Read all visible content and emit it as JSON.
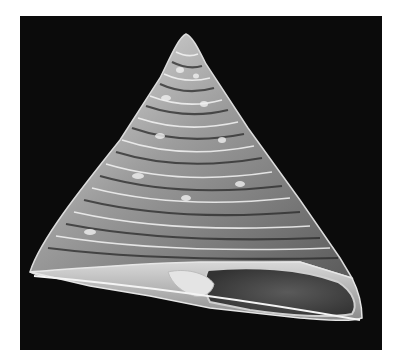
{
  "image": {
    "subject": "top shell specimen (conical gastropod shell) photographed on black background",
    "background_color": "#0b0b0b",
    "page_background": "#ffffff",
    "shell_colors": {
      "highlight": "#f2f2f2",
      "mid": "#9a9a9a",
      "shadow": "#3a3a3a",
      "aperture": "#4a4a4a"
    }
  }
}
